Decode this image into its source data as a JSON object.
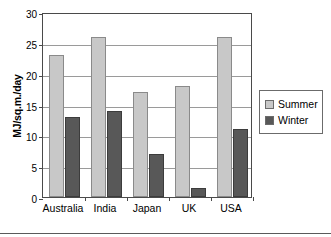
{
  "chart_data": {
    "type": "bar",
    "title": "",
    "subtitle": "",
    "xlabel": "",
    "ylabel": "MJ/sq.m./day",
    "categories": [
      "Australia",
      "India",
      "Japan",
      "UK",
      "USA"
    ],
    "series": [
      {
        "name": "Summer",
        "values": [
          23,
          26,
          17,
          18,
          26
        ],
        "color": "#c8c8c8"
      },
      {
        "name": "Winter",
        "values": [
          13,
          14,
          7,
          1.5,
          11
        ],
        "color": "#585858"
      }
    ],
    "ylim": [
      0,
      30
    ],
    "ytick_step": 5,
    "ytick_labels": [
      "0",
      "5",
      "10",
      "15",
      "20",
      "25",
      "30"
    ],
    "grid": "horizontal",
    "legend_position": "right",
    "annotations": []
  },
  "legend": {
    "entries": [
      {
        "label": "Summer",
        "swatch_color": "#c8c8c8"
      },
      {
        "label": "Winter",
        "swatch_color": "#585858"
      }
    ]
  },
  "axis": {
    "y_title": "MJ/sq.m./day"
  }
}
